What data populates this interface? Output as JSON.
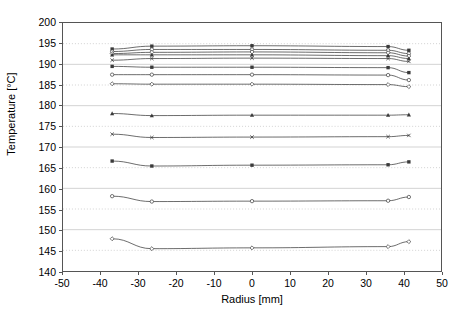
{
  "chart_data": {
    "type": "line",
    "title": "",
    "xlabel": "Radius [mm]",
    "ylabel": "Temperature [°C]",
    "xlim": [
      -50,
      50
    ],
    "ylim": [
      140,
      200
    ],
    "xticks": [
      -50,
      -40,
      -30,
      -20,
      -10,
      0,
      10,
      20,
      30,
      40,
      50
    ],
    "yticks": [
      140,
      145,
      150,
      155,
      160,
      165,
      170,
      175,
      180,
      185,
      190,
      195,
      200
    ],
    "grid": "horizontal-dotted",
    "legend": "none",
    "x": [
      -37,
      -26.5,
      0,
      36,
      41.5
    ],
    "series": [
      {
        "name": "curve-1",
        "values": [
          193.7,
          194.4,
          194.5,
          194.3,
          193.4
        ]
      },
      {
        "name": "curve-2",
        "values": [
          193.1,
          193.6,
          193.6,
          193.4,
          192.6
        ]
      },
      {
        "name": "curve-3",
        "values": [
          192.6,
          192.9,
          193.0,
          192.8,
          192.0
        ]
      },
      {
        "name": "curve-4",
        "values": [
          192.3,
          192.3,
          192.3,
          192.1,
          191.4
        ]
      },
      {
        "name": "curve-5",
        "values": [
          191.0,
          191.4,
          191.5,
          191.4,
          190.7
        ]
      },
      {
        "name": "curve-6",
        "values": [
          189.5,
          189.3,
          189.3,
          189.2,
          188.0
        ]
      },
      {
        "name": "curve-7",
        "values": [
          187.5,
          187.5,
          187.5,
          187.4,
          186.2
        ]
      },
      {
        "name": "curve-8",
        "values": [
          185.3,
          185.2,
          185.2,
          185.1,
          184.6
        ]
      },
      {
        "name": "curve-9",
        "values": [
          178.1,
          177.6,
          177.7,
          177.7,
          177.8
        ]
      },
      {
        "name": "curve-10",
        "values": [
          173.1,
          172.3,
          172.4,
          172.5,
          172.8
        ]
      },
      {
        "name": "curve-11",
        "values": [
          166.6,
          165.4,
          165.6,
          165.7,
          166.4
        ]
      },
      {
        "name": "curve-12",
        "values": [
          158.1,
          156.8,
          156.9,
          157.0,
          157.9
        ]
      },
      {
        "name": "curve-13",
        "values": [
          147.8,
          145.4,
          145.6,
          145.9,
          147.1
        ]
      }
    ]
  },
  "style": {
    "line_color": "#3a3a3a",
    "marker_color": "#3a3a3a",
    "grid_color": "#c8c8c8",
    "frame_color": "#555555",
    "background": "#ffffff"
  }
}
